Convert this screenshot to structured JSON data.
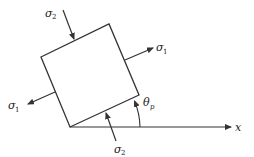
{
  "diagram": {
    "type": "principal-stress-element",
    "labels": {
      "sigma1_right": {
        "symbol": "σ",
        "subscript": "1"
      },
      "sigma1_left": {
        "symbol": "σ",
        "subscript": "1"
      },
      "sigma2_top": {
        "symbol": "σ",
        "subscript": "2"
      },
      "sigma2_bottom": {
        "symbol": "σ",
        "subscript": "2"
      },
      "theta": {
        "symbol": "θ",
        "subscript": "p"
      },
      "x_axis": "x"
    },
    "colors": {
      "stroke": "#333333",
      "text": "#222222",
      "background": "#ffffff"
    }
  }
}
